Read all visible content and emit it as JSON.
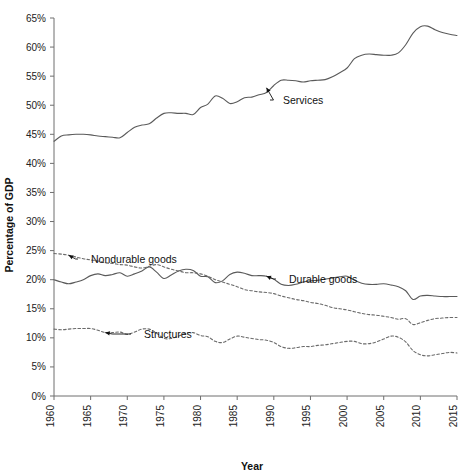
{
  "chart_data": {
    "type": "line",
    "title": "",
    "xlabel": "Year",
    "ylabel": "Percentage of GDP",
    "xlim": [
      1960,
      2015
    ],
    "ylim": [
      0,
      65
    ],
    "grid": false,
    "legend_position": "inline-annotations",
    "x_tick_labels": [
      "1960",
      "1965",
      "1970",
      "1975",
      "1980",
      "1985",
      "1990",
      "1995",
      "2000",
      "2005",
      "2010",
      "2015"
    ],
    "y_tick_labels": [
      "0%",
      "5%",
      "10%",
      "15%",
      "20%",
      "25%",
      "30%",
      "35%",
      "40%",
      "45%",
      "50%",
      "55%",
      "60%",
      "65%"
    ],
    "y_ticks": [
      0,
      5,
      10,
      15,
      20,
      25,
      30,
      35,
      40,
      45,
      50,
      55,
      60,
      65
    ],
    "x_ticks": [
      1960,
      1965,
      1970,
      1975,
      1980,
      1985,
      1990,
      1995,
      2000,
      2005,
      2010,
      2015
    ],
    "x": [
      1960,
      1961,
      1962,
      1963,
      1964,
      1965,
      1966,
      1967,
      1968,
      1969,
      1970,
      1971,
      1972,
      1973,
      1974,
      1975,
      1976,
      1977,
      1978,
      1979,
      1980,
      1981,
      1982,
      1983,
      1984,
      1985,
      1986,
      1987,
      1988,
      1989,
      1990,
      1991,
      1992,
      1993,
      1994,
      1995,
      1996,
      1997,
      1998,
      1999,
      2000,
      2001,
      2002,
      2003,
      2004,
      2005,
      2006,
      2007,
      2008,
      2009,
      2010,
      2011,
      2012,
      2013,
      2014,
      2015
    ],
    "series": [
      {
        "name": "Services",
        "style": "solid",
        "color": "#5a5a5a",
        "values": [
          43.8,
          44.7,
          44.9,
          45.0,
          45.0,
          44.9,
          44.7,
          44.6,
          44.5,
          44.4,
          45.3,
          46.2,
          46.6,
          46.8,
          47.8,
          48.6,
          48.7,
          48.6,
          48.6,
          48.4,
          49.6,
          50.2,
          51.6,
          51.2,
          50.3,
          50.6,
          51.3,
          51.4,
          51.8,
          52.2,
          53.4,
          54.3,
          54.3,
          54.2,
          54.0,
          54.2,
          54.3,
          54.4,
          54.9,
          55.6,
          56.4,
          58.0,
          58.6,
          58.8,
          58.7,
          58.6,
          58.6,
          59.0,
          60.4,
          62.4,
          63.5,
          63.6,
          63.0,
          62.5,
          62.2,
          62.0
        ],
        "annotation": {
          "label": "Services",
          "x": 1989,
          "y": 53.0
        }
      },
      {
        "name": "Durable goods",
        "style": "solid",
        "color": "#5a5a5a",
        "values": [
          20.0,
          19.6,
          19.3,
          19.6,
          20.0,
          20.7,
          21.0,
          20.7,
          20.9,
          21.2,
          20.6,
          21.0,
          21.5,
          22.2,
          21.3,
          20.2,
          20.8,
          21.5,
          21.8,
          21.6,
          20.6,
          20.5,
          19.5,
          19.8,
          20.9,
          21.3,
          21.1,
          20.7,
          20.7,
          20.6,
          20.1,
          19.2,
          19.0,
          19.2,
          19.6,
          19.8,
          19.9,
          20.1,
          20.3,
          20.5,
          20.6,
          19.9,
          19.4,
          19.2,
          19.2,
          19.3,
          19.1,
          18.8,
          18.1,
          16.6,
          17.2,
          17.3,
          17.2,
          17.1,
          17.1,
          17.1
        ],
        "annotation": {
          "label": "Durable goods",
          "x": 1989,
          "y": 20.6
        }
      },
      {
        "name": "Nondurable goods",
        "style": "dashed",
        "color": "#6a6a6a",
        "values": [
          24.5,
          24.4,
          24.2,
          23.9,
          23.6,
          23.4,
          23.2,
          22.9,
          22.8,
          22.6,
          22.5,
          22.2,
          22.0,
          22.3,
          22.6,
          22.2,
          21.8,
          21.5,
          21.2,
          21.2,
          21.0,
          20.6,
          20.0,
          19.6,
          19.2,
          18.8,
          18.3,
          18.1,
          17.9,
          17.8,
          17.6,
          17.2,
          16.9,
          16.6,
          16.4,
          16.1,
          15.9,
          15.6,
          15.2,
          15.0,
          14.8,
          14.5,
          14.2,
          14.0,
          13.9,
          13.7,
          13.5,
          13.2,
          13.3,
          12.3,
          12.6,
          13.0,
          13.3,
          13.4,
          13.5,
          13.5
        ],
        "annotation": {
          "label": "Nondurable goods",
          "x": 1962,
          "y": 24.2
        }
      },
      {
        "name": "Structures",
        "style": "dashed",
        "color": "#6a6a6a",
        "values": [
          11.5,
          11.4,
          11.5,
          11.6,
          11.6,
          11.6,
          11.3,
          10.9,
          10.9,
          11.0,
          10.6,
          11.0,
          11.5,
          11.5,
          10.8,
          9.9,
          9.9,
          10.3,
          10.8,
          10.9,
          10.4,
          10.2,
          9.4,
          9.2,
          9.8,
          10.3,
          10.1,
          9.9,
          9.7,
          9.6,
          9.2,
          8.5,
          8.2,
          8.3,
          8.5,
          8.5,
          8.7,
          8.8,
          9.0,
          9.2,
          9.4,
          9.4,
          9.0,
          9.0,
          9.3,
          9.8,
          10.3,
          10.1,
          9.3,
          7.8,
          7.1,
          6.9,
          7.1,
          7.3,
          7.5,
          7.4
        ],
        "annotation": {
          "label": "Structures",
          "x": 1967,
          "y": 10.9
        }
      }
    ]
  },
  "axes": {
    "x_axis_title": "Year",
    "y_axis_title": "Percentage of GDP"
  }
}
